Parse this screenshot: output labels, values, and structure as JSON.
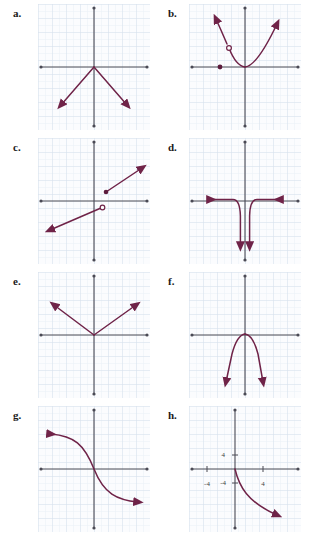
{
  "page": {
    "panel_count": 8,
    "background_color": "#ffffff",
    "grid_color": "#dfe6ef",
    "grid_minor_color": "#eaf0f6",
    "axis_color": "#4a4a55",
    "curve_color": "#7a2a4f",
    "label_color": "#1a1a1a"
  },
  "panels": [
    {
      "id": "a",
      "label": "a.",
      "column": "left",
      "row": 0,
      "description": "inverted V shape, vertex at origin, two rays going down-left and down-right with arrowheads",
      "axis_labels": [],
      "features": [
        "vertex-at-origin",
        "two-rays-downward",
        "arrow-both-ends"
      ],
      "open_circles": [],
      "closed_points": []
    },
    {
      "id": "b",
      "label": "b.",
      "column": "right",
      "row": 0,
      "description": "upward parabola with vertex at origin on the right branch, plus a separate steep segment on the left rising to an arrow, with an open circle at its top and a closed point on the x-axis",
      "axis_labels": [],
      "features": [
        "parabola-up",
        "piecewise-branch",
        "open-circle",
        "closed-point",
        "arrow-both-ends"
      ],
      "open_circles": [
        {
          "x": -1.2,
          "y": 1.7
        }
      ],
      "closed_points": [
        {
          "x": -2.0,
          "y": 0.0
        }
      ]
    },
    {
      "id": "c",
      "label": "c.",
      "column": "left",
      "row": 1,
      "description": "two parallel increasing line segments with a jump discontinuity at the origin; open circle just right of origin below axis, closed point up-right",
      "axis_labels": [],
      "features": [
        "two-line-segments",
        "jump-discontinuity",
        "open-circle",
        "closed-point",
        "arrow-both-ends"
      ],
      "open_circles": [
        {
          "x": 0.7,
          "y": -0.35
        }
      ],
      "closed_points": [
        {
          "x": 1.0,
          "y": 0.9
        }
      ]
    },
    {
      "id": "d",
      "label": "d.",
      "column": "right",
      "row": 1,
      "description": "rational function with vertical asymptote at x=0 and horizontal asymptote y=0; both branches drop downward near the asymptote, tails run left and right along the x-axis with arrowheads",
      "axis_labels": [],
      "features": [
        "vertical-asymptote",
        "horizontal-asymptote",
        "two-branches-down",
        "arrow-four-ends"
      ],
      "open_circles": [],
      "closed_points": []
    },
    {
      "id": "e",
      "label": "e.",
      "column": "left",
      "row": 2,
      "description": "V shape (absolute value) with vertex at origin, two rays rising to upper-left and upper-right with arrowheads",
      "axis_labels": [],
      "features": [
        "vertex-at-origin",
        "two-rays-upward",
        "arrow-both-ends"
      ],
      "open_circles": [],
      "closed_points": []
    },
    {
      "id": "f",
      "label": "f.",
      "column": "right",
      "row": 2,
      "description": "narrow downward-opening parabola with vertex at origin, both arms ending in downward arrowheads below the grid center",
      "axis_labels": [],
      "features": [
        "parabola-down",
        "vertex-at-origin",
        "arrow-both-ends"
      ],
      "open_circles": [],
      "closed_points": []
    },
    {
      "id": "g",
      "label": "g.",
      "column": "left",
      "row": 3,
      "description": "decreasing S-shaped curve (negative cubic / odd root) through the origin; arrow to upper-left and arrow to lower-right",
      "axis_labels": [],
      "features": [
        "s-curve",
        "decreasing",
        "through-origin",
        "arrow-both-ends"
      ],
      "open_circles": [],
      "closed_points": []
    },
    {
      "id": "h",
      "label": "h.",
      "column": "right",
      "row": 3,
      "description": "curve starting at the origin and falling steeply into the fourth quadrant, ending with an arrowhead; axes are labeled with 4 and -4 tick values",
      "axis_labels": [
        {
          "text": "4",
          "axis": "y",
          "value": 4,
          "position": "above-origin-left-side"
        },
        {
          "text": "-4",
          "axis": "y",
          "value": -4,
          "position": "below-origin-left-side"
        },
        {
          "text": "-4",
          "axis": "x",
          "value": -4,
          "position": "left-of-origin-below"
        },
        {
          "text": "4",
          "axis": "x",
          "value": 4,
          "position": "right-of-origin-below"
        }
      ],
      "features": [
        "decreasing-curve",
        "starts-at-origin",
        "fourth-quadrant",
        "arrow-one-end",
        "tick-labels"
      ],
      "open_circles": [],
      "closed_points": []
    }
  ]
}
